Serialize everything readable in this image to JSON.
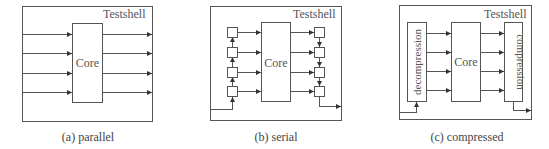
{
  "figure": {
    "panels": [
      {
        "id": "a",
        "container_label": "Testshell",
        "core_label": "Core",
        "caption": "(a) parallel",
        "input_arrows": 4,
        "output_arrows": 4
      },
      {
        "id": "b",
        "container_label": "Testshell",
        "core_label": "Core",
        "caption": "(b) serial",
        "scan_cells_in": 4,
        "scan_cells_out": 4
      },
      {
        "id": "c",
        "container_label": "Testshell",
        "core_label": "Core",
        "caption": "(c) compressed",
        "decompressor_label": "decompression",
        "compressor_label": "compression"
      }
    ]
  },
  "colors": {
    "stroke": "#555555",
    "background": "#ffffff"
  }
}
